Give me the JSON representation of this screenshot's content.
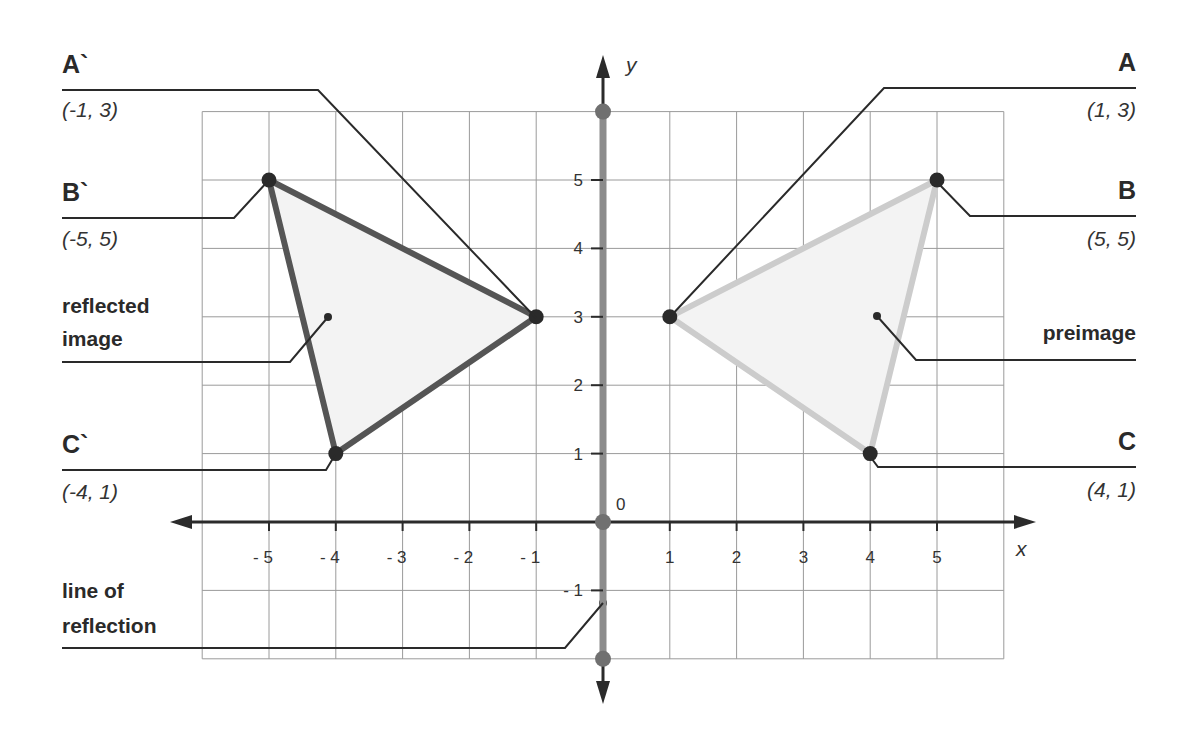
{
  "axes": {
    "x_label": "x",
    "y_label": "y",
    "origin_label": "0",
    "x_ticks": [
      -5,
      -4,
      -3,
      -2,
      -1,
      1,
      2,
      3,
      4,
      5
    ],
    "y_ticks": [
      -1,
      1,
      2,
      3,
      4,
      5
    ],
    "x_range": [
      -6,
      6
    ],
    "y_range": [
      -2,
      6
    ],
    "grid": true
  },
  "colors": {
    "grid": "#9a9a9a",
    "axis": "#2b2b2b",
    "reflection_line": "#8c8c8c",
    "reflected_edge": "#555555",
    "preimage_edge": "#cccccc",
    "fill": "#f3f3f3",
    "vertex": "#2a2a2a",
    "leader": "#2a2a2a"
  },
  "preimage": {
    "label": "preimage",
    "vertices": [
      {
        "name": "A",
        "coord_label": "(1, 3)",
        "x": 1,
        "y": 3
      },
      {
        "name": "B",
        "coord_label": "(5, 5)",
        "x": 5,
        "y": 5
      },
      {
        "name": "C",
        "coord_label": "(4, 1)",
        "x": 4,
        "y": 1
      }
    ]
  },
  "reflected": {
    "label_line1": "reflected",
    "label_line2": "image",
    "vertices": [
      {
        "name": "A`",
        "coord_label": "(-1, 3)",
        "x": -1,
        "y": 3
      },
      {
        "name": "B`",
        "coord_label": "(-5, 5)",
        "x": -5,
        "y": 5
      },
      {
        "name": "C`",
        "coord_label": "(-4, 1)",
        "x": -4,
        "y": 1
      }
    ]
  },
  "line_of_reflection": {
    "label_line1": "line of",
    "label_line2": "reflection"
  },
  "labels": {
    "left": [
      {
        "id": "A`",
        "title": "A`",
        "coord": "(-1, 3)"
      },
      {
        "id": "B`",
        "title": "B`",
        "coord": "(-5, 5)"
      },
      {
        "id": "C`",
        "title": "C`",
        "coord": "(-4, 1)"
      }
    ],
    "right": [
      {
        "id": "A",
        "title": "A",
        "coord": "(1, 3)"
      },
      {
        "id": "B",
        "title": "B",
        "coord": "(5, 5)"
      },
      {
        "id": "C",
        "title": "C",
        "coord": "(4, 1)"
      }
    ]
  }
}
